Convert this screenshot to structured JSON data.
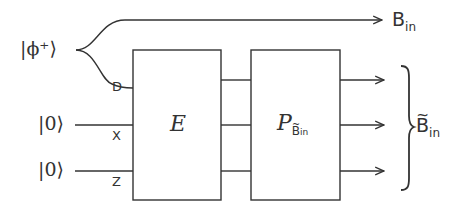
{
  "diagram": {
    "inputs": {
      "bell_state": "|ϕ⁺⟩",
      "zero_1": "|0⟩",
      "zero_2": "|0⟩"
    },
    "ports": {
      "d": "D",
      "x": "X",
      "z": "Z"
    },
    "boxes": {
      "encoder": {
        "label": "E"
      },
      "projector": {
        "label": "P",
        "subscript_base": "B",
        "subscript_suffix": "in"
      }
    },
    "outputs": {
      "top": {
        "base": "B",
        "suffix": "in"
      },
      "bracket": {
        "base": "B",
        "suffix": "in",
        "tilde": true
      }
    },
    "colors": {
      "stroke": "#333333",
      "background": "#ffffff"
    }
  }
}
